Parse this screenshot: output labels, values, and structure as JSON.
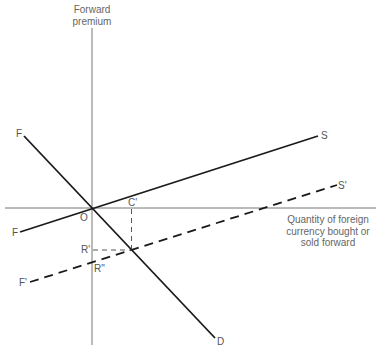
{
  "diagram": {
    "y_axis_title": [
      "Forward",
      "premium"
    ],
    "x_axis_title": [
      "Quantity of foreign",
      "currency bought or",
      "sold forward"
    ],
    "labels": {
      "origin": "O",
      "c_prime": "C'",
      "r_prime": "R'",
      "r_double": "R\"",
      "f_demand_top": "F",
      "f_supply_left": "F",
      "f_prime": "F'",
      "s": "S",
      "s_prime": "S'",
      "d": "D"
    },
    "curves": [
      {
        "name": "FS",
        "style": "solid",
        "from": "F",
        "to": "S"
      },
      {
        "name": "FD",
        "style": "solid",
        "from": "F",
        "to": "D"
      },
      {
        "name": "F'S'",
        "style": "dashed",
        "from": "F'",
        "to": "S'"
      }
    ],
    "colors": {
      "line": "#1a1a1a",
      "axis": "#777777",
      "text": "#555555"
    }
  }
}
